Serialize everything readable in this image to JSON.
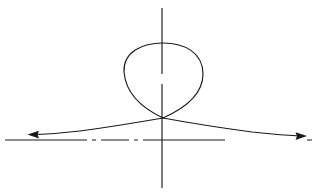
{
  "figure": {
    "background_color": "#ffffff",
    "stroke_color": "#1a1a1a",
    "width": 323,
    "height": 193,
    "axes": {
      "x_axis": {
        "name": "horizontal-axis",
        "style": "dash-dot",
        "x_start": 5,
        "x_end": 316,
        "y": 140,
        "dash_pattern": "82 5 4 5 28 5 4 5 82"
      },
      "y_axis": {
        "name": "vertical-axis",
        "style": "solid-with-gap",
        "x": 162,
        "y_start": 8,
        "y_end": 188,
        "gap_from": 74,
        "gap_to": 84
      }
    },
    "curve": {
      "name": "strophoid-curve",
      "node_point": {
        "x": 163,
        "y": 118
      },
      "loop": {
        "top_y": 44,
        "left_x": 124,
        "right_x": 202,
        "bottom_y": 118
      },
      "asymptote_y": 137,
      "left_tail_end": {
        "x": 30,
        "y": 134
      },
      "right_tail_end": {
        "x": 304,
        "y": 136
      }
    },
    "arrows": [
      {
        "name": "left-arrow",
        "direction": "left",
        "tip_x": 28,
        "tip_y": 134.5
      },
      {
        "name": "right-arrow",
        "direction": "right",
        "tip_x": 306,
        "tip_y": 136
      }
    ]
  },
  "chart_data": {
    "type": "line",
    "xlabel": "",
    "ylabel": "",
    "grid": false,
    "legend": null,
    "series": [
      {
        "name": "loop-branch",
        "x": [
          163,
          150,
          136,
          126,
          124,
          128,
          140,
          156,
          172,
          190,
          200,
          202,
          196,
          182,
          170,
          163
        ],
        "y": [
          118,
          112,
          98,
          80,
          64,
          54,
          46,
          44,
          44,
          50,
          62,
          78,
          96,
          110,
          116,
          118
        ]
      },
      {
        "name": "left-asymptotic-branch",
        "x": [
          163,
          150,
          132,
          112,
          92,
          72,
          56,
          42,
          30
        ],
        "y": [
          118,
          121,
          124,
          127,
          129,
          131,
          132,
          133,
          134
        ]
      },
      {
        "name": "right-asymptotic-branch",
        "x": [
          163,
          178,
          196,
          216,
          238,
          258,
          276,
          292,
          304
        ],
        "y": [
          118,
          122,
          125,
          128,
          131,
          133,
          134,
          135,
          136
        ]
      }
    ],
    "annotations": [
      {
        "label": "node",
        "x": 163,
        "y": 118
      },
      {
        "label": "left-arrowhead",
        "x": 28,
        "y": 134
      },
      {
        "label": "right-arrowhead",
        "x": 306,
        "y": 136
      }
    ],
    "xlim": [
      0,
      323
    ],
    "ylim": [
      193,
      0
    ]
  }
}
